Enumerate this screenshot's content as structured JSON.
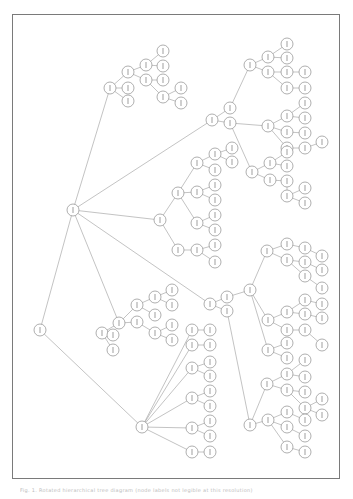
{
  "figure": {
    "frame": {
      "x": 12,
      "y": 14,
      "width": 328,
      "height": 465,
      "border_color": "#7a7a7a"
    },
    "caption": "Fig. 1. Rotated hierarchical tree diagram (node labels not legible at this resolution)",
    "node_radius": 6,
    "edge_color": "#9a9a9a",
    "node_stroke": "#8c8c8c"
  },
  "tree": {
    "nodes": [
      {
        "id": "r",
        "x": 40,
        "y": 330
      },
      {
        "id": "a",
        "x": 73,
        "y": 210
      },
      {
        "id": "b",
        "x": 142,
        "y": 427
      },
      {
        "id": "a1",
        "x": 110,
        "y": 88
      },
      {
        "id": "a1a",
        "x": 128,
        "y": 72
      },
      {
        "id": "a1b",
        "x": 128,
        "y": 88
      },
      {
        "id": "a1c",
        "x": 128,
        "y": 101
      },
      {
        "id": "a1d",
        "x": 146,
        "y": 65
      },
      {
        "id": "a1e",
        "x": 146,
        "y": 80
      },
      {
        "id": "a1f",
        "x": 163,
        "y": 51
      },
      {
        "id": "a1g",
        "x": 163,
        "y": 66
      },
      {
        "id": "a1h",
        "x": 163,
        "y": 80
      },
      {
        "id": "a1i",
        "x": 163,
        "y": 97
      },
      {
        "id": "a1j",
        "x": 181,
        "y": 88
      },
      {
        "id": "a1k",
        "x": 181,
        "y": 103
      },
      {
        "id": "a2",
        "x": 212,
        "y": 120
      },
      {
        "id": "a2a",
        "x": 230,
        "y": 108
      },
      {
        "id": "a2b",
        "x": 230,
        "y": 123
      },
      {
        "id": "a3",
        "x": 250,
        "y": 65
      },
      {
        "id": "a3a",
        "x": 268,
        "y": 57
      },
      {
        "id": "a3b",
        "x": 268,
        "y": 72
      },
      {
        "id": "a3c",
        "x": 287,
        "y": 44
      },
      {
        "id": "a3d",
        "x": 287,
        "y": 58
      },
      {
        "id": "a3e",
        "x": 287,
        "y": 72
      },
      {
        "id": "a3f",
        "x": 287,
        "y": 88
      },
      {
        "id": "a3g",
        "x": 305,
        "y": 72
      },
      {
        "id": "a3h",
        "x": 305,
        "y": 88
      },
      {
        "id": "a4",
        "x": 268,
        "y": 126
      },
      {
        "id": "a4a",
        "x": 287,
        "y": 116
      },
      {
        "id": "a4b",
        "x": 287,
        "y": 132
      },
      {
        "id": "a4c",
        "x": 287,
        "y": 148
      },
      {
        "id": "a4d",
        "x": 305,
        "y": 103
      },
      {
        "id": "a4e",
        "x": 305,
        "y": 118
      },
      {
        "id": "a4f",
        "x": 305,
        "y": 133
      },
      {
        "id": "a4g",
        "x": 305,
        "y": 148
      },
      {
        "id": "a4h",
        "x": 322,
        "y": 142
      },
      {
        "id": "a5",
        "x": 160,
        "y": 220
      },
      {
        "id": "a5a",
        "x": 178,
        "y": 193
      },
      {
        "id": "a5b",
        "x": 197,
        "y": 163
      },
      {
        "id": "a5c",
        "x": 197,
        "y": 192
      },
      {
        "id": "a5d",
        "x": 197,
        "y": 223
      },
      {
        "id": "a5e",
        "x": 215,
        "y": 154
      },
      {
        "id": "a5f",
        "x": 215,
        "y": 170
      },
      {
        "id": "a5g",
        "x": 215,
        "y": 185
      },
      {
        "id": "a5h",
        "x": 215,
        "y": 200
      },
      {
        "id": "a5i",
        "x": 215,
        "y": 215
      },
      {
        "id": "a5j",
        "x": 215,
        "y": 230
      },
      {
        "id": "a5k",
        "x": 232,
        "y": 148
      },
      {
        "id": "a5l",
        "x": 232,
        "y": 162
      },
      {
        "id": "a5m",
        "x": 178,
        "y": 250
      },
      {
        "id": "a5n",
        "x": 197,
        "y": 250
      },
      {
        "id": "a5o",
        "x": 215,
        "y": 245
      },
      {
        "id": "a5p",
        "x": 215,
        "y": 262
      },
      {
        "id": "a6",
        "x": 252,
        "y": 172
      },
      {
        "id": "a6a",
        "x": 270,
        "y": 163
      },
      {
        "id": "a6b",
        "x": 270,
        "y": 180
      },
      {
        "id": "a6c",
        "x": 287,
        "y": 152
      },
      {
        "id": "a6d",
        "x": 287,
        "y": 166
      },
      {
        "id": "a6e",
        "x": 287,
        "y": 181
      },
      {
        "id": "a6f",
        "x": 287,
        "y": 196
      },
      {
        "id": "a6g",
        "x": 305,
        "y": 188
      },
      {
        "id": "a6h",
        "x": 305,
        "y": 203
      },
      {
        "id": "a7",
        "x": 210,
        "y": 304
      },
      {
        "id": "a7a",
        "x": 227,
        "y": 297
      },
      {
        "id": "a7b",
        "x": 227,
        "y": 311
      },
      {
        "id": "a8",
        "x": 250,
        "y": 290
      },
      {
        "id": "a8a",
        "x": 267,
        "y": 251
      },
      {
        "id": "a8b",
        "x": 287,
        "y": 244
      },
      {
        "id": "a8c",
        "x": 287,
        "y": 260
      },
      {
        "id": "a8d",
        "x": 305,
        "y": 248
      },
      {
        "id": "a8e",
        "x": 305,
        "y": 262
      },
      {
        "id": "a8f",
        "x": 305,
        "y": 276
      },
      {
        "id": "a8g",
        "x": 322,
        "y": 256
      },
      {
        "id": "a8h",
        "x": 322,
        "y": 270
      },
      {
        "id": "a8i",
        "x": 322,
        "y": 288
      },
      {
        "id": "a9",
        "x": 268,
        "y": 320
      },
      {
        "id": "a9a",
        "x": 287,
        "y": 312
      },
      {
        "id": "a9b",
        "x": 287,
        "y": 330
      },
      {
        "id": "a9c",
        "x": 305,
        "y": 300
      },
      {
        "id": "a9d",
        "x": 305,
        "y": 314
      },
      {
        "id": "a9e",
        "x": 305,
        "y": 330
      },
      {
        "id": "a9f",
        "x": 322,
        "y": 304
      },
      {
        "id": "a9g",
        "x": 322,
        "y": 318
      },
      {
        "id": "a9h",
        "x": 322,
        "y": 345
      },
      {
        "id": "a10",
        "x": 268,
        "y": 350
      },
      {
        "id": "a10a",
        "x": 287,
        "y": 343
      },
      {
        "id": "a10b",
        "x": 287,
        "y": 358
      },
      {
        "id": "a11",
        "x": 250,
        "y": 425
      },
      {
        "id": "a11a",
        "x": 267,
        "y": 384
      },
      {
        "id": "a11b",
        "x": 287,
        "y": 374
      },
      {
        "id": "a11c",
        "x": 287,
        "y": 390
      },
      {
        "id": "a11d",
        "x": 305,
        "y": 360
      },
      {
        "id": "a11e",
        "x": 305,
        "y": 377
      },
      {
        "id": "a11f",
        "x": 305,
        "y": 392
      },
      {
        "id": "a11g",
        "x": 305,
        "y": 408
      },
      {
        "id": "a11h",
        "x": 322,
        "y": 399
      },
      {
        "id": "a11i",
        "x": 322,
        "y": 415
      },
      {
        "id": "a11j",
        "x": 268,
        "y": 420
      },
      {
        "id": "a11k",
        "x": 287,
        "y": 412
      },
      {
        "id": "a11l",
        "x": 287,
        "y": 427
      },
      {
        "id": "a11m",
        "x": 287,
        "y": 447
      },
      {
        "id": "a11n",
        "x": 305,
        "y": 420
      },
      {
        "id": "a11o",
        "x": 305,
        "y": 436
      },
      {
        "id": "a11p",
        "x": 305,
        "y": 452
      },
      {
        "id": "c1",
        "x": 119,
        "y": 323
      },
      {
        "id": "c1a",
        "x": 137,
        "y": 305
      },
      {
        "id": "c1b",
        "x": 137,
        "y": 322
      },
      {
        "id": "c1c",
        "x": 155,
        "y": 297
      },
      {
        "id": "c1d",
        "x": 155,
        "y": 315
      },
      {
        "id": "c1e",
        "x": 155,
        "y": 333
      },
      {
        "id": "c1f",
        "x": 172,
        "y": 290
      },
      {
        "id": "c1g",
        "x": 172,
        "y": 305
      },
      {
        "id": "c1h",
        "x": 172,
        "y": 325
      },
      {
        "id": "c1i",
        "x": 172,
        "y": 340
      },
      {
        "id": "c1j",
        "x": 102,
        "y": 333
      },
      {
        "id": "c1k",
        "x": 113,
        "y": 335
      },
      {
        "id": "c1l",
        "x": 113,
        "y": 350
      },
      {
        "id": "b1",
        "x": 192,
        "y": 330
      },
      {
        "id": "b1a",
        "x": 210,
        "y": 330
      },
      {
        "id": "b2",
        "x": 192,
        "y": 345
      },
      {
        "id": "b2a",
        "x": 210,
        "y": 345
      },
      {
        "id": "b3",
        "x": 192,
        "y": 368
      },
      {
        "id": "b3a",
        "x": 210,
        "y": 362
      },
      {
        "id": "b3b",
        "x": 210,
        "y": 376
      },
      {
        "id": "b4",
        "x": 192,
        "y": 398
      },
      {
        "id": "b4a",
        "x": 210,
        "y": 391
      },
      {
        "id": "b4b",
        "x": 210,
        "y": 406
      },
      {
        "id": "b5",
        "x": 192,
        "y": 428
      },
      {
        "id": "b5a",
        "x": 210,
        "y": 421
      },
      {
        "id": "b5b",
        "x": 210,
        "y": 436
      },
      {
        "id": "b6",
        "x": 192,
        "y": 452
      },
      {
        "id": "b6a",
        "x": 210,
        "y": 452
      }
    ],
    "edges": [
      [
        "r",
        "a"
      ],
      [
        "r",
        "b"
      ],
      [
        "a",
        "a1"
      ],
      [
        "a",
        "a2"
      ],
      [
        "a",
        "a5"
      ],
      [
        "a",
        "a7"
      ],
      [
        "a",
        "c1"
      ],
      [
        "a1",
        "a1a"
      ],
      [
        "a1",
        "a1b"
      ],
      [
        "a1",
        "a1c"
      ],
      [
        "a1a",
        "a1d"
      ],
      [
        "a1a",
        "a1e"
      ],
      [
        "a1d",
        "a1f"
      ],
      [
        "a1d",
        "a1g"
      ],
      [
        "a1e",
        "a1h"
      ],
      [
        "a1e",
        "a1i"
      ],
      [
        "a1i",
        "a1j"
      ],
      [
        "a1i",
        "a1k"
      ],
      [
        "a2",
        "a2a"
      ],
      [
        "a2",
        "a2b"
      ],
      [
        "a2a",
        "a3"
      ],
      [
        "a2b",
        "a4"
      ],
      [
        "a3",
        "a3a"
      ],
      [
        "a3",
        "a3b"
      ],
      [
        "a3a",
        "a3c"
      ],
      [
        "a3a",
        "a3d"
      ],
      [
        "a3b",
        "a3e"
      ],
      [
        "a3b",
        "a3f"
      ],
      [
        "a3e",
        "a3g"
      ],
      [
        "a3f",
        "a3h"
      ],
      [
        "a4",
        "a4a"
      ],
      [
        "a4",
        "a4b"
      ],
      [
        "a4",
        "a4c"
      ],
      [
        "a4a",
        "a4d"
      ],
      [
        "a4a",
        "a4e"
      ],
      [
        "a4b",
        "a4f"
      ],
      [
        "a4c",
        "a4g"
      ],
      [
        "a4g",
        "a4h"
      ],
      [
        "a5",
        "a5a"
      ],
      [
        "a5",
        "a5m"
      ],
      [
        "a5a",
        "a5b"
      ],
      [
        "a5a",
        "a5c"
      ],
      [
        "a5a",
        "a5d"
      ],
      [
        "a5b",
        "a5e"
      ],
      [
        "a5b",
        "a5f"
      ],
      [
        "a5e",
        "a5k"
      ],
      [
        "a5e",
        "a5l"
      ],
      [
        "a5c",
        "a5g"
      ],
      [
        "a5c",
        "a5h"
      ],
      [
        "a5d",
        "a5i"
      ],
      [
        "a5d",
        "a5j"
      ],
      [
        "a5m",
        "a5n"
      ],
      [
        "a5n",
        "a5o"
      ],
      [
        "a5n",
        "a5p"
      ],
      [
        "a2b",
        "a6"
      ],
      [
        "a6",
        "a6a"
      ],
      [
        "a6",
        "a6b"
      ],
      [
        "a6a",
        "a6c"
      ],
      [
        "a6a",
        "a6d"
      ],
      [
        "a6b",
        "a6e"
      ],
      [
        "a6e",
        "a6f"
      ],
      [
        "a6f",
        "a6g"
      ],
      [
        "a6f",
        "a6h"
      ],
      [
        "a7",
        "a7a"
      ],
      [
        "a7",
        "a7b"
      ],
      [
        "a7a",
        "a8"
      ],
      [
        "a7b",
        "a11"
      ],
      [
        "a8",
        "a8a"
      ],
      [
        "a8",
        "a9"
      ],
      [
        "a8",
        "a10"
      ],
      [
        "a8a",
        "a8b"
      ],
      [
        "a8a",
        "a8c"
      ],
      [
        "a8b",
        "a8d"
      ],
      [
        "a8c",
        "a8e"
      ],
      [
        "a8c",
        "a8f"
      ],
      [
        "a8d",
        "a8g"
      ],
      [
        "a8e",
        "a8h"
      ],
      [
        "a8f",
        "a8i"
      ],
      [
        "a9",
        "a9a"
      ],
      [
        "a9",
        "a9b"
      ],
      [
        "a9a",
        "a9c"
      ],
      [
        "a9a",
        "a9d"
      ],
      [
        "a9b",
        "a9e"
      ],
      [
        "a9c",
        "a9f"
      ],
      [
        "a9d",
        "a9g"
      ],
      [
        "a9e",
        "a9h"
      ],
      [
        "a10",
        "a10a"
      ],
      [
        "a10",
        "a10b"
      ],
      [
        "a11",
        "a11a"
      ],
      [
        "a11",
        "a11j"
      ],
      [
        "a11a",
        "a11b"
      ],
      [
        "a11a",
        "a11c"
      ],
      [
        "a11b",
        "a11d"
      ],
      [
        "a11b",
        "a11e"
      ],
      [
        "a11c",
        "a11f"
      ],
      [
        "a11c",
        "a11g"
      ],
      [
        "a11g",
        "a11h"
      ],
      [
        "a11g",
        "a11i"
      ],
      [
        "a11j",
        "a11k"
      ],
      [
        "a11j",
        "a11l"
      ],
      [
        "a11j",
        "a11m"
      ],
      [
        "a11k",
        "a11n"
      ],
      [
        "a11l",
        "a11o"
      ],
      [
        "a11m",
        "a11p"
      ],
      [
        "c1",
        "c1a"
      ],
      [
        "c1",
        "c1b"
      ],
      [
        "c1a",
        "c1c"
      ],
      [
        "c1a",
        "c1d"
      ],
      [
        "c1b",
        "c1e"
      ],
      [
        "c1c",
        "c1f"
      ],
      [
        "c1c",
        "c1g"
      ],
      [
        "c1e",
        "c1h"
      ],
      [
        "c1e",
        "c1i"
      ],
      [
        "c1",
        "c1j"
      ],
      [
        "c1j",
        "c1k"
      ],
      [
        "c1j",
        "c1l"
      ],
      [
        "b",
        "b1"
      ],
      [
        "b",
        "b2"
      ],
      [
        "b",
        "b3"
      ],
      [
        "b",
        "b4"
      ],
      [
        "b",
        "b5"
      ],
      [
        "b",
        "b6"
      ],
      [
        "b1",
        "b1a"
      ],
      [
        "b2",
        "b2a"
      ],
      [
        "b3",
        "b3a"
      ],
      [
        "b3",
        "b3b"
      ],
      [
        "b4",
        "b4a"
      ],
      [
        "b4",
        "b4b"
      ],
      [
        "b5",
        "b5a"
      ],
      [
        "b5",
        "b5b"
      ],
      [
        "b6",
        "b6a"
      ]
    ]
  }
}
